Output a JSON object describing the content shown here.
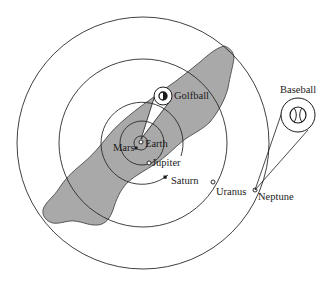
{
  "diagram": {
    "type": "scale-model solar system over landmass",
    "colors": {
      "landmass": "#a9a9a9",
      "orbit_line": "#2a2a2a",
      "background": "#ffffff"
    },
    "center": {
      "x": 142,
      "y": 142
    },
    "orbits": [
      {
        "name": "orbit-1",
        "r": 8
      },
      {
        "name": "orbit-2",
        "r": 22
      },
      {
        "name": "orbit-3",
        "r": 41
      },
      {
        "name": "orbit-4",
        "r": 84
      },
      {
        "name": "orbit-5",
        "r": 126
      }
    ],
    "labels": {
      "earth": "Earth",
      "mars": "Mars",
      "jupiter": "Jupiter",
      "saturn": "Saturn",
      "uranus": "Uranus",
      "neptune": "Neptune",
      "golfball": "Golfball",
      "baseball": "Baseball"
    },
    "planets": [
      {
        "name": "Earth",
        "marker": "open-circle"
      },
      {
        "name": "Mars",
        "marker": "solid-square"
      },
      {
        "name": "Jupiter",
        "marker": "open-circle"
      },
      {
        "name": "Saturn",
        "marker": "solid-square"
      },
      {
        "name": "Uranus",
        "marker": "open-circle"
      },
      {
        "name": "Neptune",
        "marker": "open-circle"
      }
    ],
    "insets": [
      {
        "name": "Golfball",
        "attached_to": "Earth"
      },
      {
        "name": "Baseball",
        "attached_to": "Neptune"
      }
    ]
  }
}
